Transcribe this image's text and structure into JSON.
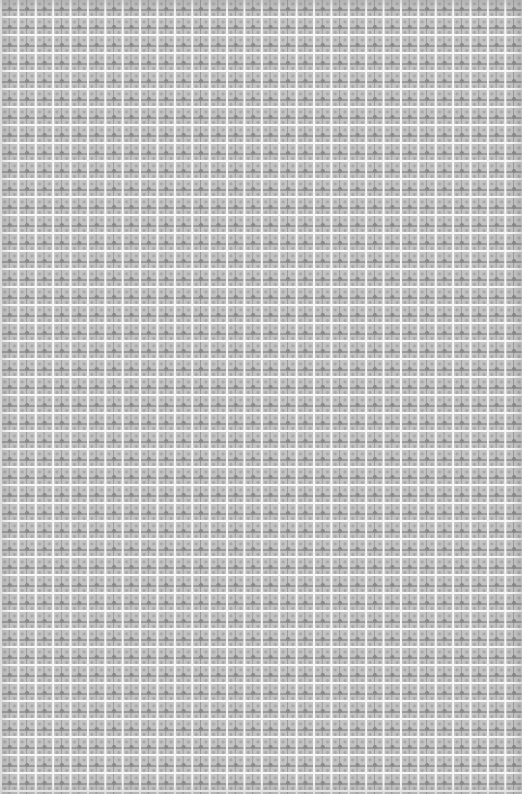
{
  "image": {
    "description": "Repeating gray tiled lattice pattern with white grid lines and small cross/flower motifs",
    "columns": 30,
    "rows": 44,
    "colors": {
      "background": "#c4c4c4",
      "grid_lines": "#f7f7f7",
      "motif": "#8a8a8a",
      "motif_light": "#a8a8a8"
    }
  }
}
